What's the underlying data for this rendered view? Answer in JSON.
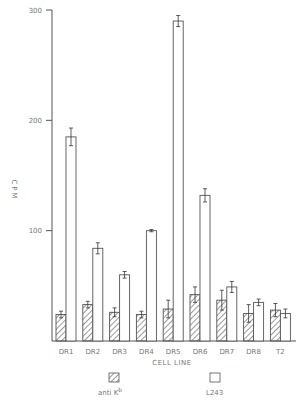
{
  "chart_data": {
    "type": "bar",
    "title": "",
    "xlabel": "CELL LINE",
    "ylabel": "CPM",
    "ylim": [
      0,
      300
    ],
    "yticks": [
      100,
      200,
      300
    ],
    "grid": false,
    "legend_position": "bottom",
    "categories": [
      "DR1",
      "DR2",
      "DR3",
      "DR4",
      "DR5",
      "DR6",
      "DR7",
      "DR8",
      "T2"
    ],
    "series": [
      {
        "name": "anti K^b",
        "label_base": "anti K",
        "label_sup": "b",
        "pattern": "hatched",
        "values": [
          24,
          33,
          26,
          24,
          29,
          42,
          37,
          25,
          28
        ],
        "errors": [
          3,
          3,
          4,
          3,
          8,
          7,
          9,
          8,
          6
        ]
      },
      {
        "name": "L243",
        "pattern": "open",
        "values": [
          185,
          84,
          60,
          100,
          290,
          132,
          49,
          35,
          25
        ],
        "errors": [
          8,
          5,
          3,
          1,
          5,
          6,
          5,
          3,
          4
        ]
      }
    ]
  },
  "labels": {
    "ylabel": "CPM",
    "xlabel": "CELL LINE",
    "legend_hatched_base": "anti K",
    "legend_hatched_sup": "b",
    "legend_open": "L243"
  }
}
